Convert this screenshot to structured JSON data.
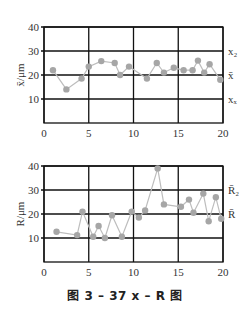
{
  "caption": "图 3 – 37    x – R 图",
  "colors": {
    "axis": "#111111",
    "grid": "#111111",
    "series_line": "#bdbdbd",
    "series_point": "#a6a6a6"
  },
  "chart_data": [
    {
      "type": "line",
      "title": "",
      "xlabel": "",
      "ylabel": "x̄/μm",
      "xlim": [
        0,
        20
      ],
      "ylim": [
        0,
        40
      ],
      "x_ticks": [
        "0",
        "5",
        "10",
        "15",
        "20"
      ],
      "y_ticks": [
        "10",
        "20",
        "30",
        "40"
      ],
      "grid": true,
      "right_labels": [
        {
          "text": "x₂",
          "y": 30
        },
        {
          "text": "x̄",
          "y": 20
        },
        {
          "text": "xₓ",
          "y": 10
        }
      ],
      "series": [
        {
          "name": "x̄",
          "x": [
            1.0,
            2.5,
            4.2,
            5.0,
            6.4,
            7.9,
            8.5,
            9.5,
            11.5,
            12.6,
            13.4,
            14.5,
            15.6,
            16.6,
            17.2,
            17.9,
            18.5,
            19.7
          ],
          "values": [
            22,
            14,
            18.5,
            23.5,
            25.8,
            25,
            20,
            23.5,
            18.5,
            25,
            21,
            23,
            22,
            22,
            26,
            21,
            24.5,
            18
          ]
        }
      ]
    },
    {
      "type": "line",
      "title": "",
      "xlabel": "",
      "ylabel": "R/μm",
      "xlim": [
        0,
        20
      ],
      "ylim": [
        0,
        40
      ],
      "x_ticks": [
        "0",
        "5",
        "10",
        "15",
        "20"
      ],
      "y_ticks": [
        "10",
        "20",
        "30",
        "40"
      ],
      "grid": true,
      "right_labels": [
        {
          "text": "R̄₂",
          "y": 30
        },
        {
          "text": "R̄",
          "y": 20
        }
      ],
      "series": [
        {
          "name": "R",
          "x": [
            1.4,
            3.7,
            4.3,
            5.5,
            6.1,
            6.8,
            7.6,
            8.7,
            9.8,
            10.6,
            11.3,
            12.7,
            13.4,
            15.3,
            16.2,
            16.7,
            17.8,
            18.4,
            19.2,
            19.8
          ],
          "values": [
            12.6,
            11.2,
            21,
            10.5,
            15,
            10,
            19.5,
            10.5,
            21,
            18.5,
            21.5,
            39,
            24,
            23,
            26,
            20.5,
            28.5,
            17,
            27,
            18
          ]
        }
      ]
    }
  ]
}
